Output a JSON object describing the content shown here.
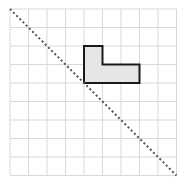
{
  "diagram": {
    "type": "grid-reflection",
    "grid": {
      "columns": 9,
      "rows": 9,
      "origin_px": [
        10,
        9
      ],
      "cell_px": 18.5,
      "line_color": "#d9d9d9"
    },
    "mirror_line": {
      "style": "dashed",
      "color": "#555555",
      "from_grid": [
        0,
        0
      ],
      "to_grid": [
        9,
        9
      ]
    },
    "shape": {
      "name": "L-shape",
      "fill": "#e6e6e6",
      "stroke": "#1a1a1a",
      "vertices_grid": [
        [
          4,
          2
        ],
        [
          5,
          2
        ],
        [
          5,
          3
        ],
        [
          7,
          3
        ],
        [
          7,
          4
        ],
        [
          4,
          4
        ]
      ]
    }
  }
}
